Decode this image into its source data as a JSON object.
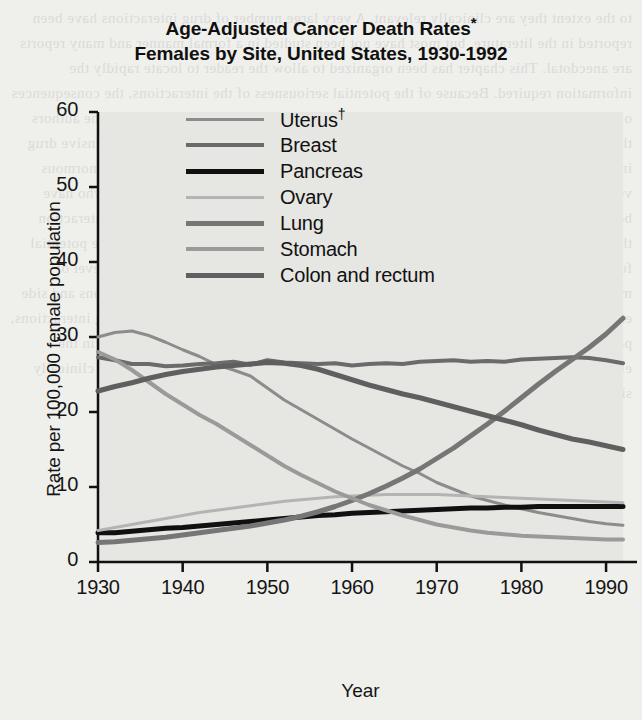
{
  "title": {
    "line1": "Age-Adjusted Cancer Death Rates",
    "line1_sup": "*",
    "line2": "Females by Site, United States, 1930-1992"
  },
  "legend": {
    "items": [
      {
        "label": "Uterus",
        "sup": "†",
        "color": "#8c8c8c",
        "width": 3
      },
      {
        "label": "Breast",
        "sup": "",
        "color": "#6b6b6b",
        "width": 4
      },
      {
        "label": "Pancreas",
        "sup": "",
        "color": "#101010",
        "width": 5
      },
      {
        "label": "Ovary",
        "sup": "",
        "color": "#b4b4b4",
        "width": 3
      },
      {
        "label": "Lung",
        "sup": "",
        "color": "#767676",
        "width": 5
      },
      {
        "label": "Stomach",
        "sup": "",
        "color": "#9a9a9a",
        "width": 4
      },
      {
        "label": "Colon and rectum",
        "sup": "",
        "color": "#5f5f5f",
        "width": 5
      }
    ]
  },
  "bleed_text": "to the extent they are clinically relevant. A very large number of drug interactions have been reported in the literature, but most have not been studied in a formal manner and many reports are anecdotal. This chapter has been organized to allow the reader to locate rapidly the information required. Because of the potential seriousness of the interactions, the consequences of the drug interaction are summarized in a descriptive manner. It is the intent of the authors that this chapter be used in conjunction with the primary literature and a comprehensive drug interaction textbook. A review of any of these reference sources will indicate the enormous volume of available literature. Patients with an altered physiologic state or those who have been exposed to numerous drugs are at much greater risk of experiencing a drug interaction than individuals who are generally healthy. The complexity of drug therapy and the potential for serious adverse effects has increased the risk of serious drug interaction. The level of medication exposure has been associated with a higher incidence of drug interactions and side effects. Some primary diseases are also associated with a greater incidence of drug interactions, particularly cancers, cardiac disease, and liver disease. The increased use of drugs in the elderly and the presence of multiple concurrent illnesses make the probability of a clinically significant interaction much greater in this population than in the young.",
  "chart_data": {
    "type": "line",
    "xlabel": "Year",
    "ylabel": "Rate per 100,000 female population",
    "xlim": [
      1930,
      1992
    ],
    "ylim": [
      0,
      60
    ],
    "xticks": [
      1930,
      1940,
      1950,
      1960,
      1970,
      1980,
      1990
    ],
    "yticks": [
      0,
      10,
      20,
      30,
      40,
      50,
      60
    ],
    "grid": false,
    "legend_position": "top-center-inside",
    "footnote_markers": {
      "asterisk": "*",
      "dagger": "†"
    },
    "x": [
      1930,
      1932,
      1934,
      1936,
      1938,
      1940,
      1942,
      1944,
      1946,
      1948,
      1950,
      1952,
      1954,
      1956,
      1958,
      1960,
      1962,
      1964,
      1966,
      1968,
      1970,
      1972,
      1974,
      1976,
      1978,
      1980,
      1982,
      1984,
      1986,
      1988,
      1990,
      1992
    ],
    "series": [
      {
        "name": "Uterus",
        "color": "#8c8c8c",
        "width": 3,
        "values": [
          30.0,
          30.6,
          30.8,
          30.2,
          29.3,
          28.3,
          27.4,
          26.3,
          25.6,
          24.8,
          23.2,
          21.6,
          20.3,
          19.0,
          17.7,
          16.4,
          15.2,
          14.0,
          12.8,
          11.8,
          10.6,
          9.7,
          8.8,
          8.2,
          7.6,
          7.1,
          6.6,
          6.2,
          5.8,
          5.4,
          5.1,
          4.9
        ]
      },
      {
        "name": "Breast",
        "color": "#6b6b6b",
        "width": 4,
        "values": [
          27.3,
          26.9,
          26.4,
          26.4,
          26.1,
          26.2,
          26.4,
          26.5,
          26.7,
          26.3,
          26.9,
          26.6,
          26.5,
          26.4,
          26.5,
          26.2,
          26.4,
          26.5,
          26.4,
          26.7,
          26.8,
          26.9,
          26.7,
          26.8,
          26.7,
          27.0,
          27.1,
          27.2,
          27.3,
          27.2,
          26.9,
          26.5
        ]
      },
      {
        "name": "Pancreas",
        "color": "#101010",
        "width": 5,
        "values": [
          3.9,
          3.9,
          4.1,
          4.3,
          4.5,
          4.6,
          4.8,
          5.0,
          5.2,
          5.4,
          5.6,
          5.8,
          6.0,
          6.2,
          6.3,
          6.5,
          6.6,
          6.7,
          6.8,
          6.9,
          7.0,
          7.1,
          7.2,
          7.2,
          7.3,
          7.3,
          7.4,
          7.4,
          7.4,
          7.4,
          7.4,
          7.4
        ]
      },
      {
        "name": "Ovary",
        "color": "#b4b4b4",
        "width": 3,
        "values": [
          4.2,
          4.6,
          5.0,
          5.4,
          5.8,
          6.2,
          6.6,
          6.9,
          7.2,
          7.5,
          7.8,
          8.1,
          8.3,
          8.5,
          8.7,
          8.8,
          8.9,
          9.0,
          9.0,
          9.0,
          9.0,
          8.9,
          8.8,
          8.7,
          8.6,
          8.5,
          8.4,
          8.3,
          8.2,
          8.1,
          8.0,
          7.9
        ]
      },
      {
        "name": "Lung",
        "color": "#767676",
        "width": 5,
        "values": [
          2.6,
          2.7,
          2.9,
          3.1,
          3.3,
          3.6,
          3.9,
          4.2,
          4.5,
          4.8,
          5.2,
          5.6,
          6.1,
          6.7,
          7.4,
          8.2,
          9.1,
          10.1,
          11.2,
          12.4,
          13.8,
          15.2,
          16.8,
          18.4,
          20.1,
          21.9,
          23.7,
          25.4,
          27.0,
          28.6,
          30.4,
          32.5
        ]
      },
      {
        "name": "Stomach",
        "color": "#9a9a9a",
        "width": 4,
        "values": [
          28.0,
          27.0,
          25.6,
          24.0,
          22.4,
          21.0,
          19.6,
          18.4,
          17.0,
          15.6,
          14.2,
          12.8,
          11.6,
          10.5,
          9.4,
          8.5,
          7.6,
          6.9,
          6.2,
          5.6,
          5.0,
          4.6,
          4.2,
          3.9,
          3.7,
          3.5,
          3.4,
          3.3,
          3.2,
          3.1,
          3.0,
          3.0
        ]
      },
      {
        "name": "Colon and rectum",
        "color": "#5f5f5f",
        "width": 5,
        "values": [
          22.8,
          23.4,
          23.9,
          24.5,
          25.0,
          25.4,
          25.7,
          26.0,
          26.2,
          26.4,
          26.6,
          26.5,
          26.2,
          25.7,
          25.0,
          24.3,
          23.6,
          23.0,
          22.4,
          21.9,
          21.3,
          20.7,
          20.1,
          19.5,
          18.9,
          18.3,
          17.6,
          17.0,
          16.4,
          16.0,
          15.5,
          15.0
        ]
      }
    ]
  }
}
